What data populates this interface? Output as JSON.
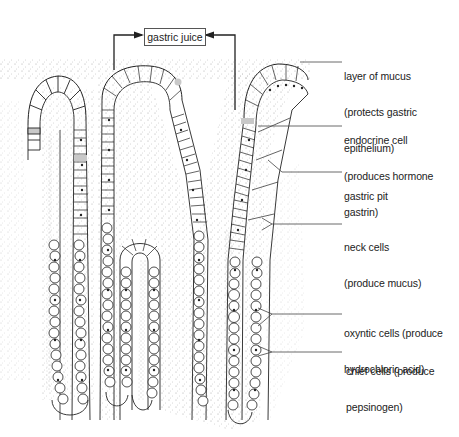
{
  "diagram": {
    "title_box": "gastric juice",
    "labels": [
      {
        "id": "layer-of-mucus",
        "line1": "layer of mucus",
        "line2": "(protects gastric",
        "line3": "epithelium)"
      },
      {
        "id": "endocrine-cell",
        "line1": "endocrine cell",
        "line2": "(produces hormone",
        "line3": "gastrin)"
      },
      {
        "id": "gastric-pit",
        "line1": "gastric pit"
      },
      {
        "id": "neck-cells",
        "line1": "neck cells",
        "line2": "(produce mucus)"
      },
      {
        "id": "oxyntic-cells",
        "line1": "oxyntic cells (produce",
        "line2": "hydrochloric acid)"
      },
      {
        "id": "chief-cells",
        "line1": "chief cells (produce",
        "line2": "pepsinogen)"
      }
    ],
    "colors": {
      "line": "#222222",
      "stipple": "#9a9a9a",
      "endocrine_fill": "#c8c8c8"
    }
  }
}
